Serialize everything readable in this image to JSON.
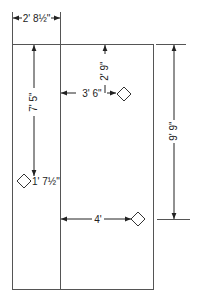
{
  "diagram": {
    "dimensions": {
      "top_width": "2' 8½\"",
      "left_vertical": "7' 5\"",
      "center_vertical": "2' 9\"",
      "upper_horizontal": "3' 6\"",
      "left_outlet_offset": "1' 7½\"",
      "lower_horizontal": "4'",
      "right_vertical": "9' 9\""
    },
    "markers": [
      {
        "name": "outlet-upper-right",
        "shape": "diamond"
      },
      {
        "name": "outlet-left",
        "shape": "diamond"
      },
      {
        "name": "outlet-lower-right",
        "shape": "diamond"
      }
    ],
    "colors": {
      "line": "#555555",
      "text": "#222222",
      "background": "#ffffff"
    }
  }
}
